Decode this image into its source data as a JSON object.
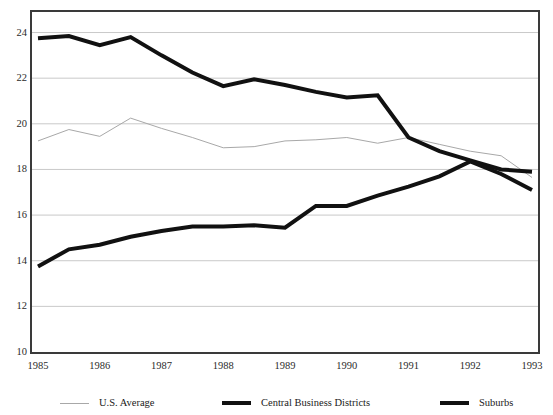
{
  "figure": {
    "title_remnant": "",
    "background_color": "#ffffff",
    "frame_color": "#3a3a3a",
    "gridline_color": "#c9c9c9"
  },
  "chart_data": {
    "type": "line",
    "title": "",
    "subtitle": "",
    "xlabel": "",
    "ylabel": "",
    "xlim": [
      1985,
      1993
    ],
    "ylim": [
      10,
      24.9
    ],
    "grid": true,
    "grid_axis": "y",
    "legend_position": "bottom",
    "x_tick_labels": [
      "1985",
      "1986",
      "1987",
      "1988",
      "1989",
      "1990",
      "1991",
      "1992",
      "1993"
    ],
    "x_ticks": [
      1985,
      1986,
      1987,
      1988,
      1989,
      1990,
      1991,
      1992,
      1993
    ],
    "y_tick_labels": [
      "24",
      "22",
      "20",
      "18",
      "16",
      "14",
      "12",
      "10"
    ],
    "y_ticks": [
      24,
      22,
      20,
      18,
      16,
      14,
      12,
      10
    ],
    "x": [
      1985,
      1985.5,
      1986,
      1986.5,
      1987,
      1987.5,
      1988,
      1988.5,
      1989,
      1989.5,
      1990,
      1990.5,
      1991,
      1991.5,
      1992,
      1992.5,
      1993
    ],
    "series": [
      {
        "name": "U.S. Average",
        "color": "#a8a8a8",
        "width": 1,
        "style": "thin",
        "values": [
          19.25,
          19.75,
          19.45,
          20.25,
          19.8,
          19.4,
          18.95,
          19.0,
          19.25,
          19.3,
          19.4,
          19.15,
          19.4,
          19.1,
          18.8,
          18.6,
          17.65
        ]
      },
      {
        "name": "Central Business Districts",
        "color": "#111111",
        "width": 4,
        "style": "thick",
        "values": [
          23.75,
          23.85,
          23.45,
          23.8,
          23.0,
          22.25,
          21.65,
          21.95,
          21.7,
          21.4,
          21.15,
          21.25,
          19.4,
          18.8,
          18.4,
          18.0,
          17.9
        ]
      },
      {
        "name": "Suburbs",
        "color": "#111111",
        "width": 4,
        "style": "thick",
        "values": [
          13.75,
          14.5,
          14.7,
          15.05,
          15.3,
          15.5,
          15.5,
          15.55,
          15.45,
          16.4,
          16.4,
          16.85,
          17.25,
          17.7,
          18.35,
          17.8,
          17.1
        ]
      }
    ]
  },
  "legend": {
    "items": [
      {
        "label": "U.S. Average",
        "style": "thin",
        "color": "#a8a8a8",
        "left": 60
      },
      {
        "label": "Central Business Districts",
        "style": "thick",
        "color": "#111111",
        "left": 222
      },
      {
        "label": "Suburbs",
        "style": "thick",
        "color": "#111111",
        "left": 440
      }
    ]
  }
}
